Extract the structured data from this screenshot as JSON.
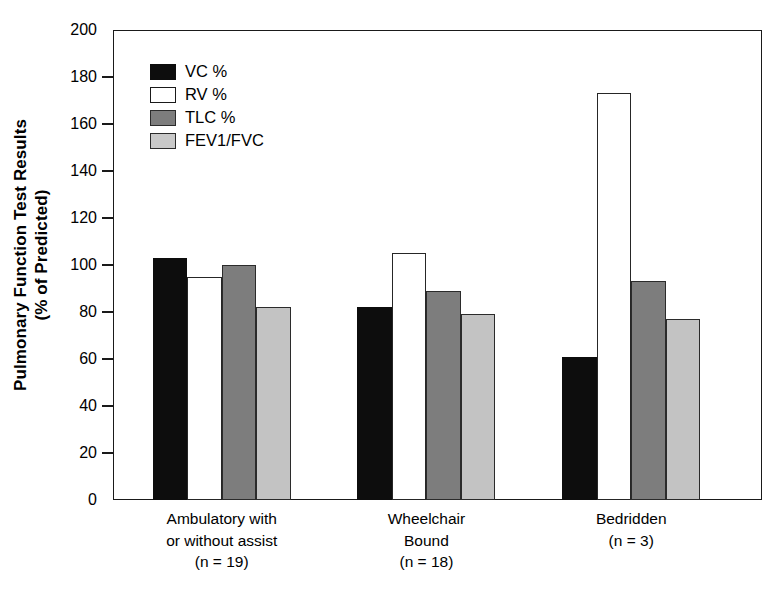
{
  "chart_data": {
    "type": "bar",
    "title": "",
    "xlabel": "",
    "ylabel": "Pulmonary Function Test Results (% of Predicted)",
    "ylabel_line1": "Pulmonary Function Test Results",
    "ylabel_line2": "(% of Predicted)",
    "ylim": [
      0,
      200
    ],
    "ytick_step": 20,
    "yticks": [
      200,
      180,
      160,
      140,
      120,
      100,
      80,
      60,
      40,
      20,
      0
    ],
    "ytick_labels": [
      "200",
      "180",
      "160",
      "140",
      "120",
      "100",
      "80",
      "60",
      "40",
      "20",
      "0"
    ],
    "grid": false,
    "legend_position": "upper-left-inside",
    "categories": [
      "Ambulatory with or without assist (n = 19)",
      "Wheelchair Bound (n = 18)",
      "Bedridden (n = 3)"
    ],
    "category_lines": [
      [
        "Ambulatory with",
        "or without assist",
        "(n = 19)"
      ],
      [
        "Wheelchair",
        "Bound",
        "(n = 18)"
      ],
      [
        "Bedridden",
        "(n = 3)",
        ""
      ]
    ],
    "series": [
      {
        "name": "VC %",
        "color": "#0d0d0d",
        "values": [
          103,
          82,
          61
        ]
      },
      {
        "name": "RV %",
        "color": "#ffffff",
        "values": [
          95,
          105,
          173
        ]
      },
      {
        "name": "TLC %",
        "color": "#7d7d7d",
        "values": [
          100,
          89,
          93
        ]
      },
      {
        "name": "FEV1/FVC",
        "color": "#c3c3c3",
        "values": [
          82,
          79,
          77
        ]
      }
    ]
  },
  "legend": {
    "items": [
      {
        "label": "VC %"
      },
      {
        "label": "RV %"
      },
      {
        "label": "TLC %"
      },
      {
        "label": "FEV1/FVC"
      }
    ]
  }
}
